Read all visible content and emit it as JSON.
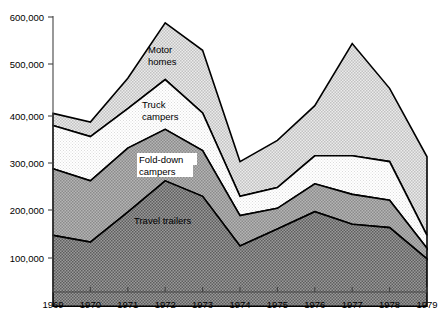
{
  "chart_data": {
    "type": "area",
    "stacked": true,
    "title": "",
    "subtitle": "",
    "xlabel": "",
    "ylabel": "",
    "categories": [
      "1969",
      "1970",
      "1971",
      "1972",
      "1973",
      "1974",
      "1975",
      "1976",
      "1977",
      "1978",
      "1979"
    ],
    "x": [
      1969,
      1970,
      1971,
      1972,
      1973,
      1974,
      1975,
      1976,
      1977,
      1978,
      1979
    ],
    "xlim": [
      1969,
      1979
    ],
    "ylim": [
      0,
      600000
    ],
    "yticks": [
      100000,
      200000,
      300000,
      400000,
      500000,
      600000
    ],
    "ytick_labels": [
      "100,000",
      "200,000",
      "300,000",
      "400,000",
      "500,000",
      "600,000"
    ],
    "xtick_labels": [
      "1969",
      "1970",
      "1971",
      "1972",
      "1973",
      "1974",
      "1975",
      "1976",
      "1977",
      "1978",
      "1979"
    ],
    "grid": false,
    "legend": "inline-labels",
    "series": [
      {
        "name": "Travel trailers",
        "label": "Travel trailers",
        "fill": "#8a8a8a",
        "values": [
          147000,
          133000,
          195000,
          260000,
          228000,
          125000,
          160000,
          196000,
          170000,
          163000,
          98000
        ]
      },
      {
        "name": "Fold-down campers",
        "label": "Fold-down campers",
        "fill": "#a8a8a8",
        "values": [
          138000,
          127000,
          133000,
          107000,
          95000,
          63000,
          43000,
          58000,
          62000,
          57000,
          22000
        ]
      },
      {
        "name": "Truck campers",
        "label": "Truck campers",
        "fill": "#f2f2f2",
        "values": [
          90000,
          92000,
          82000,
          103000,
          78000,
          40000,
          43000,
          58000,
          80000,
          80000,
          27000
        ]
      },
      {
        "name": "Motor homes",
        "label": "Motor homes",
        "fill": "#d6d6d6",
        "values": [
          25000,
          30000,
          63000,
          118000,
          130000,
          72000,
          98000,
          104000,
          233000,
          152000,
          163000
        ]
      }
    ],
    "cumulative_tops": {
      "travel_trailers": [
        147000,
        133000,
        195000,
        260000,
        228000,
        125000,
        160000,
        196000,
        170000,
        163000,
        98000
      ],
      "fold_down_campers": [
        285000,
        260000,
        328000,
        367000,
        323000,
        188000,
        203000,
        254000,
        232000,
        220000,
        120000
      ],
      "truck_campers": [
        375000,
        352000,
        410000,
        470000,
        401000,
        228000,
        246000,
        312000,
        312000,
        300000,
        147000
      ],
      "motor_homes": [
        400000,
        382000,
        473000,
        588000,
        531000,
        300000,
        344000,
        416000,
        545000,
        452000,
        310000
      ]
    },
    "colors": {
      "travel_trailers": "#8a8a8a",
      "fold_down_campers": "#a8a8a8",
      "truck_campers": "#f2f2f2",
      "motor_homes": "#d6d6d6",
      "outline": "#000000",
      "axis": "#000000",
      "background": "#ffffff"
    }
  },
  "axes": {
    "y_tick_labels": [
      "600,000",
      "500,000",
      "400,000",
      "300,000",
      "200,000",
      "100,000"
    ],
    "x_tick_labels": [
      "1969",
      "1970",
      "1971",
      "1972",
      "1973",
      "1974",
      "1975",
      "1976",
      "1977",
      "1978",
      "1979"
    ]
  },
  "labels": {
    "motor_homes_line1": "Motor",
    "motor_homes_line2": "homes",
    "truck_campers_line1": "Truck",
    "truck_campers_line2": "campers",
    "fold_down_line1": "Fold-down",
    "fold_down_line2": "campers",
    "travel_trailers": "Travel trailers"
  }
}
